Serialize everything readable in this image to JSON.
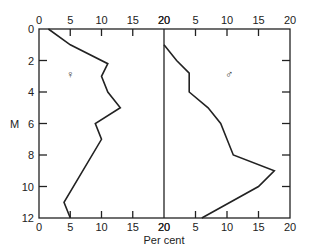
{
  "chart_data": {
    "type": "line",
    "title": "",
    "xlabel": "Per cent",
    "ylabel": "M",
    "ylim": [
      0,
      12
    ],
    "y_ticks": [
      "0",
      "2",
      "4",
      "6",
      "8",
      "10",
      "12"
    ],
    "panels": [
      {
        "name": "female",
        "symbol": "♀",
        "xlim": [
          0,
          20
        ],
        "x_ticks": [
          "0",
          "5",
          "10",
          "15",
          "20"
        ],
        "series": [
          {
            "name": "♀",
            "points": [
              [
                1.5,
                0
              ],
              [
                5,
                1
              ],
              [
                11,
                2.2
              ],
              [
                10,
                3
              ],
              [
                11,
                4
              ],
              [
                13,
                5
              ],
              [
                9,
                6
              ],
              [
                10,
                7
              ],
              [
                4,
                11
              ],
              [
                5,
                12
              ]
            ]
          }
        ]
      },
      {
        "name": "male",
        "symbol": "♂",
        "xlim": [
          0,
          20
        ],
        "x_ticks": [
          "20",
          "5",
          "10",
          "15",
          "20"
        ],
        "series": [
          {
            "name": "♂",
            "points": [
              [
                0,
                1
              ],
              [
                2,
                2
              ],
              [
                4,
                2.8
              ],
              [
                4,
                4
              ],
              [
                7,
                5
              ],
              [
                9,
                6
              ],
              [
                10,
                7
              ],
              [
                11,
                8
              ],
              [
                17.5,
                9
              ],
              [
                15,
                10
              ],
              [
                6,
                12
              ]
            ]
          }
        ]
      }
    ]
  },
  "labels": {
    "y_axis": "M",
    "x_axis": "Per cent",
    "female_symbol": "♀",
    "male_symbol": "♂"
  }
}
